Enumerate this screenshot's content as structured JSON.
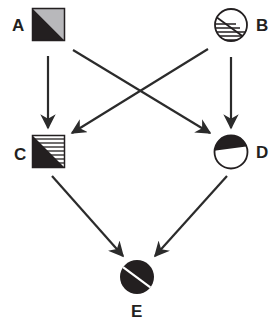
{
  "diagram": {
    "type": "directed-graph",
    "colors": {
      "ink": "#231f20",
      "line": "#2b2b2b",
      "gray_fill": "#b8b8bb",
      "white": "#ffffff"
    },
    "nodes": [
      {
        "id": "A",
        "label": "A",
        "shape": "square",
        "fill": "diagonal split: black lower-left, gray upper-right"
      },
      {
        "id": "B",
        "label": "B",
        "shape": "circle",
        "fill": "diagonal split: horizontal hatching lower-left, white upper-right"
      },
      {
        "id": "C",
        "label": "C",
        "shape": "square",
        "fill": "diagonal split: black lower-left, horizontal hatching upper-right"
      },
      {
        "id": "D",
        "label": "D",
        "shape": "circle",
        "fill": "diagonal split: black upper-right, white lower-left"
      },
      {
        "id": "E",
        "label": "E",
        "shape": "circle",
        "fill": "solid black with white diagonal line"
      }
    ],
    "edges": [
      {
        "from": "A",
        "to": "C"
      },
      {
        "from": "A",
        "to": "D"
      },
      {
        "from": "B",
        "to": "C"
      },
      {
        "from": "B",
        "to": "D"
      },
      {
        "from": "C",
        "to": "E"
      },
      {
        "from": "D",
        "to": "E"
      }
    ]
  }
}
